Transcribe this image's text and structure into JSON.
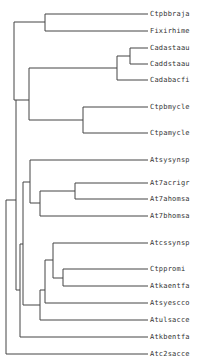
{
  "diagram": {
    "type": "phylogenetic-tree",
    "line_color": "#444444",
    "leaves": [
      {
        "label": "Ctpbbraja",
        "y": 14
      },
      {
        "label": "Fixirhime",
        "y": 31
      },
      {
        "label": "Cadastaau",
        "y": 48
      },
      {
        "label": "Caddstaau",
        "y": 64
      },
      {
        "label": "Cadabacfi",
        "y": 80
      },
      {
        "label": "Ctpbmycle",
        "y": 107
      },
      {
        "label": "Ctpamycle",
        "y": 133
      },
      {
        "label": "Atsysynsp",
        "y": 160
      },
      {
        "label": "At7acrigr",
        "y": 183
      },
      {
        "label": "At7ahomsa",
        "y": 199
      },
      {
        "label": "At7bhomsa",
        "y": 216
      },
      {
        "label": "Atcssynsp",
        "y": 243
      },
      {
        "label": "Ctppromi",
        "y": 269
      },
      {
        "label": "Atkaentfa",
        "y": 286
      },
      {
        "label": "Atsyescco",
        "y": 303
      },
      {
        "label": "Atulsacce",
        "y": 320
      },
      {
        "label": "Atkbentfa",
        "y": 337
      },
      {
        "label": "Atc2sacce",
        "y": 354
      }
    ]
  }
}
